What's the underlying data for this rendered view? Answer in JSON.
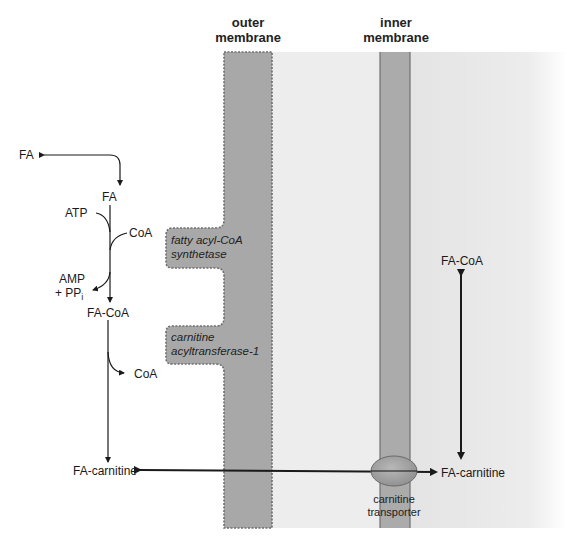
{
  "headers": {
    "outer": [
      "outer",
      "membrane"
    ],
    "inner": [
      "inner",
      "membrane"
    ]
  },
  "cytosol": {
    "fa_outside": "FA",
    "fa": "FA",
    "atp": "ATP",
    "coa_in": "CoA",
    "amp": "AMP",
    "ppi": "+ PP",
    "ppi_sub": "i",
    "fa_coa": "FA-CoA",
    "coa_out": "CoA",
    "fa_carnitine": "FA-carnitine"
  },
  "enzymes": {
    "synthetase": [
      "fatty acyl-CoA",
      "synthetase"
    ],
    "cat1": [
      "carnitine",
      "acyltransferase-1"
    ]
  },
  "matrix": {
    "fa_coa": "FA-CoA",
    "fa_carnitine": "FA-carnitine"
  },
  "transporter": [
    "carnitine",
    "transporter"
  ],
  "colors": {
    "membrane": "#a6a6a6",
    "membrane_edge": "#7a7a7a",
    "intermembrane": "#ececec",
    "matrix": "#e2e2e2",
    "arrow": "#1a1a1a"
  }
}
